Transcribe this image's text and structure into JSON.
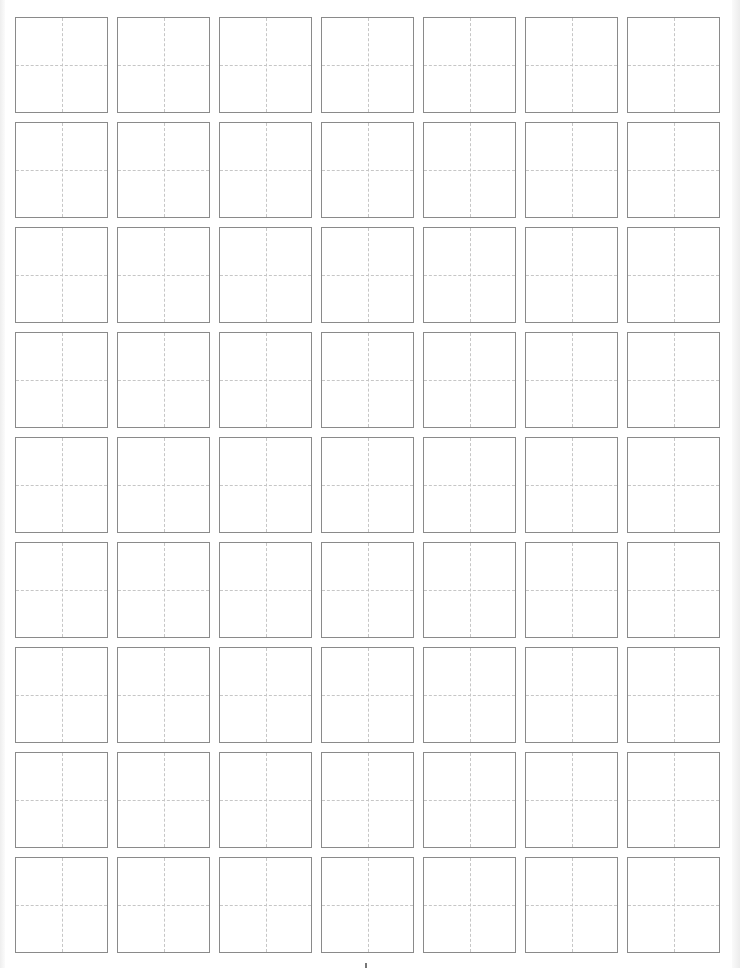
{
  "sheet": {
    "type": "tian-zi-ge practice grid",
    "rows": 9,
    "columns": 7,
    "cell_border_color": "#8a8a8a",
    "guide_line_color": "#c6c6c6",
    "guide_style": "dashed cross"
  },
  "layout": {
    "col_x": [
      15,
      117,
      219,
      321,
      423,
      525,
      627
    ],
    "row_y": [
      17,
      122,
      227,
      332,
      437,
      542,
      647,
      752,
      857
    ],
    "cell_w": 93,
    "cell_h": 96
  }
}
